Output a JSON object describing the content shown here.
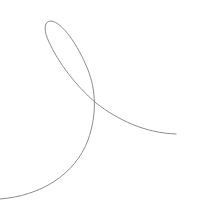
{
  "canvas": {
    "width": 197,
    "height": 216,
    "background": "#ffffff"
  },
  "curve": {
    "stroke": "#8c8c8c",
    "stroke_width": 1,
    "path": "M 0 199 C 40 196, 75 175, 88 140 C 97 115, 96 90, 88 70 C 78 45, 62 22, 51 21 C 43 21, 44 32, 49 42 C 58 62, 75 85, 96 103 C 118 120, 145 133, 176 134"
  }
}
